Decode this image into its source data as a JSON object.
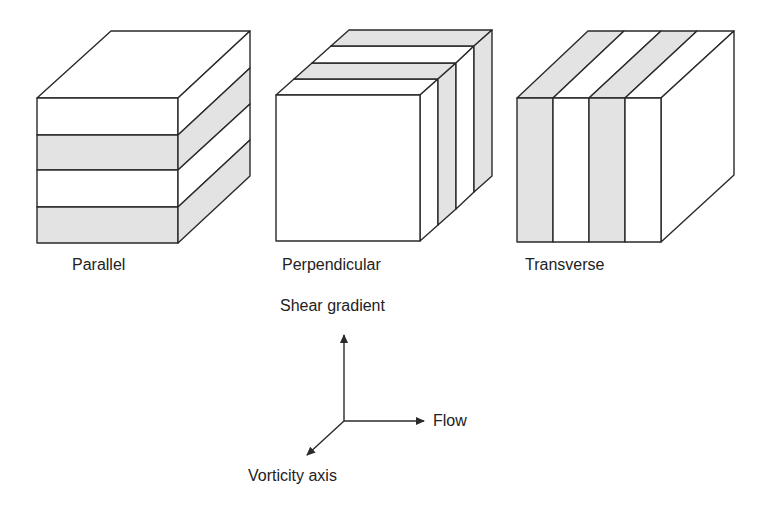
{
  "colors": {
    "stroke": "#2a2a2a",
    "shade": "#e3e3e3",
    "white": "#ffffff"
  },
  "cubes": [
    {
      "id": "parallel",
      "label": "Parallel"
    },
    {
      "id": "perpendicular",
      "label": "Perpendicular"
    },
    {
      "id": "transverse",
      "label": "Transverse"
    }
  ],
  "axes": {
    "shear_gradient": "Shear gradient",
    "flow": "Flow",
    "vorticity": "Vorticity axis"
  }
}
